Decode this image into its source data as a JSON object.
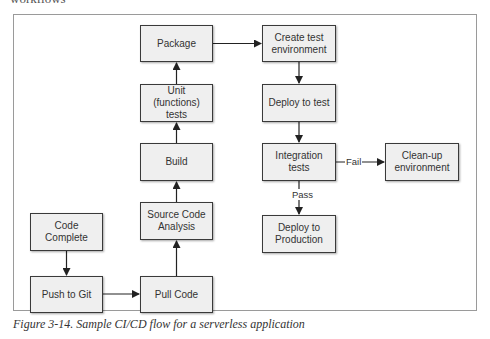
{
  "header_fragment": "workflows",
  "diagram": {
    "nodes": [
      {
        "id": "package",
        "label": "Package"
      },
      {
        "id": "create-test-env",
        "label": "Create test environment"
      },
      {
        "id": "unit-tests",
        "label": "Unit (functions) tests"
      },
      {
        "id": "deploy-to-test",
        "label": "Deploy to test"
      },
      {
        "id": "build",
        "label": "Build"
      },
      {
        "id": "integration-tests",
        "label": "Integration tests"
      },
      {
        "id": "clean-up-env",
        "label": "Clean-up environment"
      },
      {
        "id": "code-complete",
        "label": "Code Complete"
      },
      {
        "id": "source-code-analysis",
        "label": "Source Code Analysis"
      },
      {
        "id": "deploy-to-production",
        "label": "Deploy to Production"
      },
      {
        "id": "push-to-git",
        "label": "Push to Git"
      },
      {
        "id": "pull-code",
        "label": "Pull Code"
      }
    ],
    "edges": [
      {
        "from": "code-complete",
        "to": "push-to-git",
        "label": ""
      },
      {
        "from": "push-to-git",
        "to": "pull-code",
        "label": ""
      },
      {
        "from": "pull-code",
        "to": "source-code-analysis",
        "label": ""
      },
      {
        "from": "source-code-analysis",
        "to": "build",
        "label": ""
      },
      {
        "from": "build",
        "to": "unit-tests",
        "label": ""
      },
      {
        "from": "unit-tests",
        "to": "package",
        "label": ""
      },
      {
        "from": "package",
        "to": "create-test-env",
        "label": ""
      },
      {
        "from": "create-test-env",
        "to": "deploy-to-test",
        "label": ""
      },
      {
        "from": "deploy-to-test",
        "to": "integration-tests",
        "label": ""
      },
      {
        "from": "integration-tests",
        "to": "clean-up-env",
        "label": "Fail"
      },
      {
        "from": "integration-tests",
        "to": "deploy-to-production",
        "label": "Pass"
      }
    ],
    "edge_labels": {
      "fail": "Fail",
      "pass": "Pass"
    }
  },
  "caption": "Figure 3-14. Sample CI/CD flow for a serverless application"
}
